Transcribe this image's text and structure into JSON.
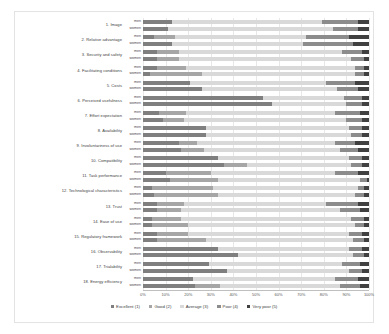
{
  "chart_data": {
    "type": "bar",
    "subtype": "stacked-horizontal-100",
    "title": "",
    "xlabel": "",
    "ylabel": "",
    "xlim": [
      0,
      100
    ],
    "xunit": "%",
    "grid": true,
    "legend_position": "bottom",
    "xticks": [
      "0%",
      "10%",
      "20%",
      "30%",
      "40%",
      "50%",
      "60%",
      "70%",
      "80%",
      "90%",
      "100%"
    ],
    "xtick_values": [
      0,
      10,
      20,
      30,
      40,
      50,
      60,
      70,
      80,
      90,
      100
    ],
    "legend": [
      {
        "label": "Excellent (1)",
        "color": "#7f7f7f"
      },
      {
        "label": "Good (2)",
        "color": "#a6a6a6"
      },
      {
        "label": "Average (3)",
        "color": "#d9d9d9"
      },
      {
        "label": "Poor (4)",
        "color": "#8c8c8c"
      },
      {
        "label": "Very poor (5)",
        "color": "#404040"
      }
    ],
    "series_names": [
      "men",
      "women"
    ],
    "categories": [
      "1. Image",
      "2. Relative advantage",
      "3. Security and safety",
      "4. Facilitating conditions",
      "5. Costs",
      "6. Perceived usefulness",
      "7. Effort expectation",
      "8. Availability",
      "9. Involuntariness of use",
      "10. Compatibility",
      "11. Task performance",
      "12. Technological characteristics",
      "13. Trust",
      "14. Ease of use",
      "15. Regulatory framework",
      "16. Observability",
      "17. Trialability",
      "18. Energy efficiency"
    ],
    "rows": [
      {
        "category": "1. Image",
        "men": [
          13,
          0,
          66,
          16,
          5
        ],
        "women": [
          11,
          0,
          73,
          11,
          5
        ]
      },
      {
        "category": "2. Relative advantage",
        "men": [
          5,
          9,
          58,
          19,
          9
        ],
        "women": [
          13,
          0,
          58,
          22,
          7
        ]
      },
      {
        "category": "3. Security and safety",
        "men": [
          6,
          10,
          72,
          9,
          3
        ],
        "women": [
          6,
          10,
          76,
          6,
          2
        ]
      },
      {
        "category": "4. Facilitating conditions",
        "men": [
          6,
          13,
          75,
          4,
          2
        ],
        "women": [
          3,
          23,
          68,
          4,
          2
        ]
      },
      {
        "category": "5. Costs",
        "men": [
          21,
          0,
          60,
          13,
          6
        ],
        "women": [
          26,
          0,
          60,
          9,
          5
        ]
      },
      {
        "category": "6. Perceived usefulness",
        "men": [
          53,
          0,
          36,
          8,
          3
        ],
        "women": [
          57,
          0,
          33,
          7,
          3
        ]
      },
      {
        "category": "7. Effort expectation",
        "men": [
          7,
          12,
          66,
          11,
          4
        ],
        "women": [
          9,
          9,
          72,
          7,
          3
        ]
      },
      {
        "category": "8. Availability",
        "men": [
          28,
          0,
          63,
          6,
          3
        ],
        "women": [
          28,
          0,
          64,
          5,
          3
        ]
      },
      {
        "category": "9. Involuntariness of use",
        "men": [
          16,
          8,
          61,
          9,
          6
        ],
        "women": [
          17,
          10,
          60,
          8,
          5
        ]
      },
      {
        "category": "10. Compatibility",
        "men": [
          33,
          0,
          58,
          6,
          3
        ],
        "women": [
          36,
          10,
          46,
          5,
          3
        ]
      },
      {
        "category": "11. Task performance",
        "men": [
          10,
          20,
          55,
          10,
          5
        ],
        "women": [
          12,
          21,
          63,
          3,
          1
        ]
      },
      {
        "category": "12. Technological characteristics",
        "men": [
          4,
          27,
          64,
          3,
          2
        ],
        "women": [
          5,
          28,
          61,
          4,
          2
        ]
      },
      {
        "category": "13. Trust",
        "men": [
          6,
          12,
          63,
          14,
          5
        ],
        "women": [
          6,
          11,
          70,
          9,
          4
        ]
      },
      {
        "category": "14. Ease of use",
        "men": [
          4,
          13,
          75,
          6,
          2
        ],
        "women": [
          4,
          16,
          74,
          4,
          2
        ]
      },
      {
        "category": "15. Regulatory framework",
        "men": [
          6,
          14,
          71,
          6,
          3
        ],
        "women": [
          6,
          22,
          65,
          5,
          2
        ]
      },
      {
        "category": "16. Observability",
        "men": [
          33,
          0,
          58,
          6,
          3
        ],
        "women": [
          42,
          0,
          51,
          5,
          2
        ]
      },
      {
        "category": "17. Trialability",
        "men": [
          29,
          0,
          59,
          8,
          4
        ],
        "women": [
          37,
          0,
          54,
          6,
          3
        ]
      },
      {
        "category": "18. Energy efficiency",
        "men": [
          22,
          0,
          63,
          10,
          5
        ],
        "women": [
          23,
          11,
          53,
          9,
          4
        ]
      }
    ]
  }
}
